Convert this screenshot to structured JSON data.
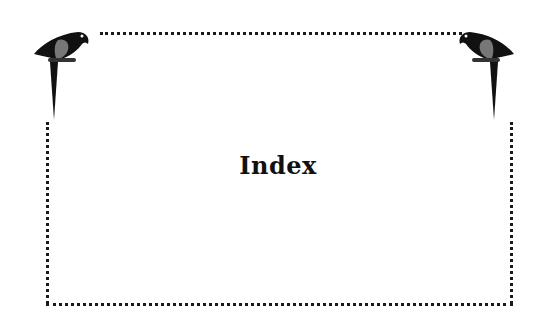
{
  "page": {
    "title": "Index"
  },
  "decorations": {
    "left_icon": "parrot-icon",
    "right_icon": "parrot-icon",
    "frame_style": "dotted-border"
  }
}
